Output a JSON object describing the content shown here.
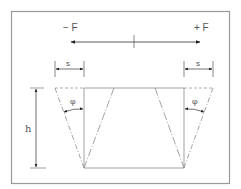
{
  "diagram": {
    "labels": {
      "force_negative": "− F",
      "force_positive": "+ F",
      "displacement_left": "s",
      "displacement_right": "s",
      "angle_left": "φ",
      "angle_right": "φ",
      "height": "h"
    },
    "colors": {
      "frame": "#9a9a9a",
      "line": "#8a8a8a",
      "arrow": "#222222",
      "text": "#555555"
    }
  }
}
